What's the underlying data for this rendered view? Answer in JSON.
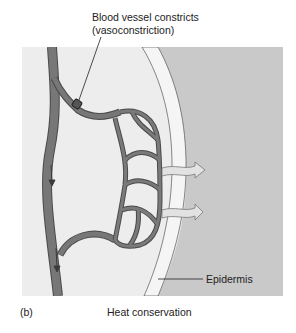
{
  "figure": {
    "panel_letter": "(b)",
    "caption": "Heat  conservation"
  },
  "labels": {
    "constriction_line1": "Blood vessel constricts",
    "constriction_line2": "(vasoconstriction)",
    "epidermis": "Epidermis"
  },
  "colors": {
    "dermis_bg": "#ededed",
    "outside_bg": "#c9c9c9",
    "epidermis_band": "#f3f3f3",
    "vessel": "#6f6f6f",
    "vessel_edge": "#4a4a4a",
    "heat_arrow": "#dcdcdc"
  }
}
